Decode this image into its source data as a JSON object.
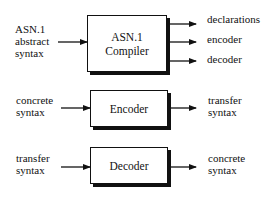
{
  "diagram": {
    "compiler": {
      "input_label_lines": [
        "ASN.1",
        "abstract",
        "syntax"
      ],
      "box_label_lines": [
        "ASN.1",
        "Compiler"
      ],
      "outputs": [
        "declarations",
        "encoder",
        "decoder"
      ]
    },
    "encoder": {
      "input_label_lines": [
        "concrete",
        "syntax"
      ],
      "box_label": "Encoder",
      "output_label_lines": [
        "transfer",
        "syntax"
      ]
    },
    "decoder": {
      "input_label_lines": [
        "transfer",
        "syntax"
      ],
      "box_label": "Decoder",
      "output_label_lines": [
        "concrete",
        "syntax"
      ]
    },
    "colors": {
      "stroke": "#111111",
      "background": "#ffffff"
    }
  }
}
